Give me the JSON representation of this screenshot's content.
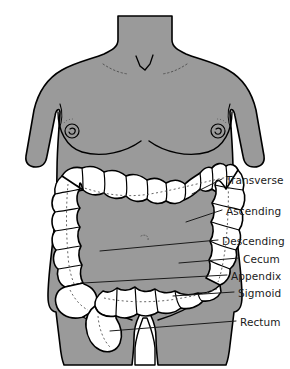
{
  "diagram": {
    "colors": {
      "background": "#ffffff",
      "body_fill": "#9a9a9a",
      "body_outline": "#000000",
      "colon_fill": "#ffffff",
      "colon_outline": "#000000",
      "leader_line": "#1a1a1a",
      "label_text": "#1a1a1a"
    },
    "labels": [
      {
        "id": "transverse",
        "text": "Transverse",
        "text_x": 226,
        "text_y": 175,
        "leader": {
          "x1": 192,
          "y1": 194,
          "x2": 222,
          "y2": 179
        }
      },
      {
        "id": "ascending",
        "text": "Ascending",
        "text_x": 226,
        "text_y": 206,
        "leader": {
          "x1": 186,
          "y1": 222,
          "x2": 222,
          "y2": 210
        }
      },
      {
        "id": "descending",
        "text": "Descending",
        "text_x": 222,
        "text_y": 236,
        "leader": {
          "x1": 100,
          "y1": 251,
          "x2": 218,
          "y2": 240
        }
      },
      {
        "id": "cecum",
        "text": "Cecum",
        "text_x": 243,
        "text_y": 254,
        "leader": {
          "x1": 179,
          "y1": 263,
          "x2": 239,
          "y2": 258
        }
      },
      {
        "id": "appendix",
        "text": "Appendix",
        "text_x": 231,
        "text_y": 271,
        "leader": {
          "x1": 83,
          "y1": 283,
          "x2": 227,
          "y2": 275
        }
      },
      {
        "id": "sigmoid",
        "text": "Sigmoid",
        "text_x": 238,
        "text_y": 288,
        "leader": {
          "x1": 173,
          "y1": 296,
          "x2": 234,
          "y2": 292
        }
      },
      {
        "id": "rectum",
        "text": "Rectum",
        "text_x": 240,
        "text_y": 317,
        "leader": {
          "x1": 110,
          "y1": 331,
          "x2": 236,
          "y2": 321
        }
      }
    ],
    "anatomy_parts": [
      "transverse-colon",
      "ascending-colon",
      "descending-colon",
      "cecum",
      "appendix",
      "sigmoid-colon",
      "rectum"
    ]
  }
}
